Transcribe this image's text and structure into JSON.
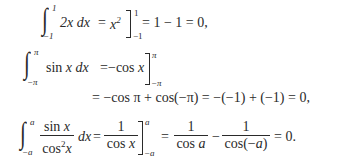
{
  "equations": [
    {
      "id": "eq1",
      "integral_lower": "−1",
      "integral_upper": "1",
      "integrand": "2x dx",
      "eq1": "=",
      "antideriv": "x",
      "antideriv_exp": "2",
      "eval_lower": "−1",
      "eval_upper": "1",
      "result": "= 1 − 1 = 0,"
    },
    {
      "id": "eq2",
      "integral_lower": "−π",
      "integral_upper": "π",
      "integrand": "sin x dx",
      "eq1": "=",
      "antideriv": "−cos x",
      "eval_lower": "−π",
      "eval_upper": "π"
    },
    {
      "id": "eq3",
      "continuation": "= −cos π + cos(−π) = −(−1) + (−1) = 0,"
    },
    {
      "id": "eq4",
      "integral_lower": "−a",
      "integral_upper": "a",
      "integrand_num": "sin x",
      "integrand_den": "cos",
      "integrand_den_exp": "2",
      "integrand_den_var": "x",
      "dx": "dx",
      "eq1": "=",
      "antideriv_num": "1",
      "antideriv_den": "cos x",
      "eval_lower": "−a",
      "eval_upper": "a",
      "eq2": "=",
      "term1_num": "1",
      "term1_den": "cos a",
      "minus": "−",
      "term2_num": "1",
      "term2_den": "cos(−a)",
      "result": "= 0."
    }
  ]
}
